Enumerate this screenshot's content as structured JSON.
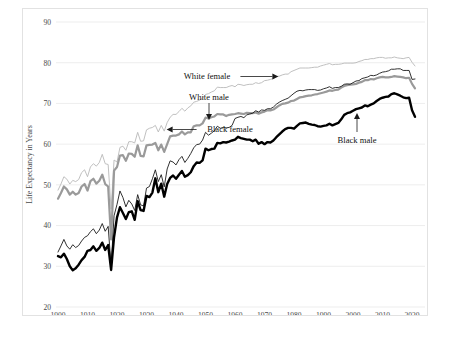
{
  "chart_data": {
    "type": "line",
    "title": "",
    "xlabel": "",
    "ylabel": "Life Expectancy in Years",
    "xlim": [
      1900,
      2021
    ],
    "ylim": [
      20,
      90
    ],
    "grid": true,
    "legend_position": "inline-annotations",
    "xticks": [
      "1900",
      "1910",
      "1920",
      "1930",
      "1940",
      "1950",
      "1960",
      "1970",
      "1980",
      "1990",
      "2000",
      "2010",
      "2020"
    ],
    "yticks": [
      "20",
      "30",
      "40",
      "50",
      "60",
      "70",
      "80",
      "90"
    ],
    "x": [
      1900,
      1901,
      1902,
      1903,
      1904,
      1905,
      1906,
      1907,
      1908,
      1909,
      1910,
      1911,
      1912,
      1913,
      1914,
      1915,
      1916,
      1917,
      1918,
      1919,
      1920,
      1921,
      1922,
      1923,
      1924,
      1925,
      1926,
      1927,
      1928,
      1929,
      1930,
      1931,
      1932,
      1933,
      1934,
      1935,
      1936,
      1937,
      1938,
      1939,
      1940,
      1941,
      1942,
      1943,
      1944,
      1945,
      1946,
      1947,
      1948,
      1949,
      1950,
      1951,
      1952,
      1953,
      1954,
      1955,
      1956,
      1957,
      1958,
      1959,
      1960,
      1961,
      1962,
      1963,
      1964,
      1965,
      1966,
      1967,
      1968,
      1969,
      1970,
      1971,
      1972,
      1973,
      1974,
      1975,
      1976,
      1977,
      1978,
      1979,
      1980,
      1981,
      1982,
      1983,
      1984,
      1985,
      1986,
      1987,
      1988,
      1989,
      1990,
      1991,
      1992,
      1993,
      1994,
      1995,
      1996,
      1997,
      1998,
      1999,
      2000,
      2001,
      2002,
      2003,
      2004,
      2005,
      2006,
      2007,
      2008,
      2009,
      2010,
      2011,
      2012,
      2013,
      2014,
      2015,
      2016,
      2017,
      2018,
      2019,
      2020,
      2021
    ],
    "series": [
      {
        "name": "White female",
        "color": "#b9b9b9",
        "width": 0.9,
        "style": "thin-light",
        "label": "White female",
        "label_arrow": "right",
        "values": [
          48.7,
          50.2,
          52.0,
          51.4,
          50.2,
          51.1,
          50.8,
          51.3,
          53.0,
          53.7,
          52.0,
          54.4,
          55.2,
          54.6,
          55.5,
          57.5,
          55.2,
          55.0,
          44.0,
          56.1,
          55.6,
          59.2,
          59.5,
          58.5,
          60.6,
          60.6,
          60.3,
          62.9,
          60.7,
          60.8,
          63.5,
          63.9,
          64.1,
          64.6,
          63.0,
          64.6,
          63.2,
          65.3,
          66.6,
          67.3,
          67.3,
          68.0,
          68.8,
          68.1,
          68.9,
          69.4,
          70.3,
          70.5,
          70.8,
          71.3,
          72.2,
          72.4,
          72.8,
          73.1,
          74.0,
          73.9,
          73.9,
          73.9,
          74.2,
          74.4,
          74.1,
          74.7,
          74.6,
          74.4,
          74.6,
          74.7,
          74.7,
          75.1,
          74.9,
          75.1,
          75.6,
          75.7,
          75.9,
          76.1,
          76.6,
          76.7,
          77.0,
          77.2,
          77.2,
          77.8,
          78.1,
          78.4,
          78.7,
          78.7,
          78.7,
          78.7,
          78.8,
          78.9,
          78.9,
          79.2,
          79.4,
          79.6,
          79.8,
          79.5,
          79.6,
          79.6,
          79.7,
          79.9,
          79.9,
          79.9,
          79.9,
          80.0,
          80.3,
          80.5,
          80.8,
          80.8,
          81.0,
          81.0,
          81.2,
          81.3,
          81.3,
          81.1,
          81.2,
          81.2,
          81.4,
          81.2,
          81.1,
          81.0,
          81.2,
          81.3,
          80.1,
          79.2
        ]
      },
      {
        "name": "White male",
        "color": "#9a9a9a",
        "width": 2.2,
        "style": "thick-gray",
        "label": "White male",
        "label_arrow": "down",
        "values": [
          46.6,
          48.0,
          49.6,
          48.9,
          47.6,
          48.3,
          47.6,
          48.0,
          49.6,
          50.2,
          48.6,
          50.9,
          51.5,
          50.3,
          51.0,
          52.5,
          50.2,
          49.6,
          36.6,
          53.5,
          54.4,
          57.2,
          57.3,
          55.9,
          57.7,
          57.6,
          56.9,
          59.7,
          57.1,
          57.0,
          59.7,
          59.8,
          59.9,
          60.3,
          58.5,
          59.9,
          58.1,
          60.0,
          61.9,
          62.1,
          62.1,
          62.4,
          63.1,
          62.4,
          62.9,
          62.9,
          64.4,
          64.6,
          64.6,
          65.1,
          66.5,
          66.3,
          66.6,
          66.8,
          67.4,
          67.3,
          67.3,
          66.9,
          67.2,
          67.3,
          67.4,
          67.6,
          67.5,
          67.4,
          67.7,
          67.6,
          67.6,
          67.8,
          67.5,
          67.8,
          68.0,
          68.3,
          68.3,
          68.5,
          69.0,
          69.5,
          69.9,
          70.0,
          70.2,
          70.6,
          70.7,
          71.1,
          71.5,
          71.6,
          71.8,
          71.9,
          72.0,
          72.2,
          72.3,
          72.5,
          72.7,
          72.9,
          73.2,
          73.1,
          73.3,
          73.4,
          73.9,
          74.3,
          74.5,
          74.6,
          74.7,
          74.8,
          75.1,
          75.3,
          75.7,
          75.7,
          76.0,
          75.9,
          76.2,
          76.4,
          76.5,
          76.4,
          76.4,
          76.5,
          76.7,
          76.6,
          76.5,
          76.4,
          76.2,
          76.3,
          74.8,
          73.7
        ]
      },
      {
        "name": "Black female",
        "color": "#1a1a1a",
        "width": 0.9,
        "style": "thin-black",
        "label": "Black female",
        "label_arrow": "left",
        "values": [
          33.5,
          35.0,
          36.6,
          35.0,
          34.2,
          35.3,
          34.6,
          35.1,
          36.2,
          37.1,
          37.5,
          38.5,
          39.2,
          38.0,
          38.9,
          40.5,
          38.6,
          39.8,
          30.0,
          42.4,
          45.2,
          48.5,
          46.9,
          44.6,
          46.2,
          45.3,
          43.7,
          47.6,
          45.1,
          44.8,
          49.2,
          49.6,
          51.5,
          53.7,
          50.8,
          52.5,
          49.5,
          53.9,
          55.9,
          55.6,
          54.9,
          56.2,
          57.0,
          55.5,
          56.5,
          57.7,
          59.1,
          59.9,
          60.0,
          61.0,
          62.9,
          62.2,
          62.7,
          63.3,
          64.4,
          63.9,
          64.1,
          64.0,
          64.1,
          64.6,
          66.3,
          66.6,
          66.8,
          66.5,
          67.2,
          67.4,
          67.6,
          68.2,
          67.9,
          68.4,
          68.3,
          68.7,
          68.7,
          69.1,
          69.8,
          70.3,
          70.7,
          71.0,
          71.3,
          71.9,
          72.5,
          73.0,
          73.2,
          73.1,
          73.3,
          73.4,
          73.4,
          73.4,
          73.2,
          73.3,
          73.6,
          73.8,
          74.1,
          73.7,
          73.9,
          73.9,
          74.2,
          74.7,
          74.8,
          74.7,
          75.1,
          75.5,
          75.6,
          76.1,
          76.3,
          76.5,
          76.9,
          76.8,
          77.0,
          77.4,
          77.7,
          77.8,
          78.0,
          78.4,
          78.4,
          78.5,
          78.5,
          78.1,
          78.1,
          78.1,
          75.9,
          76.0
        ]
      },
      {
        "name": "Black male",
        "color": "#000000",
        "width": 2.4,
        "style": "thick-black",
        "label": "Black male",
        "label_arrow": "up",
        "values": [
          32.5,
          32.2,
          33.1,
          31.8,
          30.0,
          29.0,
          29.5,
          30.4,
          31.5,
          32.3,
          33.8,
          34.0,
          34.9,
          33.8,
          34.5,
          35.8,
          34.0,
          35.2,
          29.1,
          37.2,
          42.0,
          44.5,
          43.1,
          41.6,
          43.3,
          43.5,
          41.4,
          46.0,
          43.8,
          43.6,
          47.3,
          47.0,
          48.1,
          51.6,
          48.2,
          50.3,
          47.1,
          50.2,
          51.7,
          52.3,
          51.5,
          52.5,
          53.4,
          52.0,
          52.4,
          53.1,
          54.6,
          55.5,
          55.4,
          56.0,
          58.9,
          58.5,
          58.8,
          58.9,
          60.3,
          60.2,
          60.5,
          60.4,
          60.6,
          60.9,
          61.1,
          61.8,
          61.5,
          61.3,
          61.1,
          61.1,
          60.7,
          61.1,
          60.1,
          60.5,
          60.0,
          60.5,
          60.4,
          60.9,
          61.7,
          62.4,
          63.1,
          63.7,
          64.0,
          64.0,
          63.8,
          64.5,
          65.1,
          65.2,
          65.3,
          65.0,
          64.8,
          64.7,
          64.4,
          64.3,
          64.5,
          64.6,
          65.0,
          64.6,
          64.9,
          65.2,
          66.1,
          67.2,
          67.6,
          67.8,
          68.2,
          68.6,
          68.8,
          69.0,
          69.5,
          69.3,
          69.7,
          70.0,
          70.6,
          71.1,
          71.4,
          71.6,
          71.7,
          72.3,
          72.5,
          72.2,
          71.9,
          71.5,
          71.3,
          71.4,
          68.3,
          66.7
        ]
      }
    ],
    "annotations": [
      {
        "text": "White female",
        "x": 206,
        "y": 78,
        "arrow": "right"
      },
      {
        "text": "White male",
        "x": 208,
        "y": 99,
        "arrow": "down"
      },
      {
        "text": "Black female",
        "x": 229,
        "y": 131,
        "arrow": "left"
      },
      {
        "text": "Black male",
        "x": 356,
        "y": 142,
        "arrow": "up"
      }
    ]
  }
}
